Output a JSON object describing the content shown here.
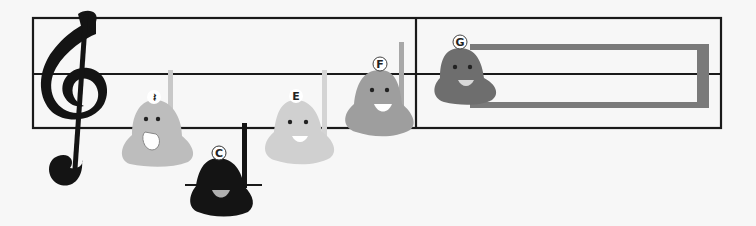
{
  "scene": {
    "description": "Musical staff with treble clef and singing bell characters",
    "colors": {
      "background": "#f7f7f7",
      "staff_line": "#1a1a1a",
      "bell_rest": "#bdbdbd",
      "bell_c": "#141414",
      "bell_e": "#d0d0d0",
      "bell_f": "#9e9e9e",
      "bell_g": "#6e6e6e",
      "long_note_box": "#7a7a7a"
    }
  },
  "staff": {
    "clef": "treble-clef",
    "barline_count": 1
  },
  "bells": [
    {
      "label": "𝄽",
      "name": "rest",
      "symbol": "𝄽"
    },
    {
      "label": "C",
      "name": "C"
    },
    {
      "label": "E",
      "name": "E"
    },
    {
      "label": "F",
      "name": "F"
    },
    {
      "label": "G",
      "name": "G"
    }
  ]
}
